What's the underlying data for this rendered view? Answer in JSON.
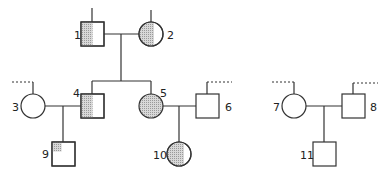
{
  "diagram": {
    "type": "pedigree",
    "colors": {
      "line": "#333333",
      "shade": "#c8c8c8",
      "background": "#ffffff"
    },
    "individuals": [
      {
        "id": "1",
        "label": "1",
        "sex": "male",
        "shading": "left-half",
        "generation": 1
      },
      {
        "id": "2",
        "label": "2",
        "sex": "female",
        "shading": "left-half",
        "generation": 1
      },
      {
        "id": "3",
        "label": "3",
        "sex": "female",
        "shading": "none",
        "generation": 2
      },
      {
        "id": "4",
        "label": "4",
        "sex": "male",
        "shading": "left-half",
        "generation": 2
      },
      {
        "id": "5",
        "label": "5",
        "sex": "female",
        "shading": "full",
        "generation": 2
      },
      {
        "id": "6",
        "label": "6",
        "sex": "male",
        "shading": "none",
        "generation": 2
      },
      {
        "id": "7",
        "label": "7",
        "sex": "female",
        "shading": "none",
        "generation": 2
      },
      {
        "id": "8",
        "label": "8",
        "sex": "male",
        "shading": "none",
        "generation": 2
      },
      {
        "id": "9",
        "label": "9",
        "sex": "male",
        "shading": "top-left-quarter",
        "generation": 3
      },
      {
        "id": "10",
        "label": "10",
        "sex": "female",
        "shading": "left-half",
        "generation": 3
      },
      {
        "id": "11",
        "label": "11",
        "sex": "male",
        "shading": "none",
        "generation": 3
      }
    ],
    "matings": [
      {
        "partners": [
          "1",
          "2"
        ],
        "children": [
          "4",
          "5"
        ]
      },
      {
        "partners": [
          "3",
          "4"
        ],
        "children": [
          "9"
        ]
      },
      {
        "partners": [
          "5",
          "6"
        ],
        "children": [
          "10"
        ]
      },
      {
        "partners": [
          "7",
          "8"
        ],
        "children": [
          "11"
        ]
      }
    ]
  }
}
